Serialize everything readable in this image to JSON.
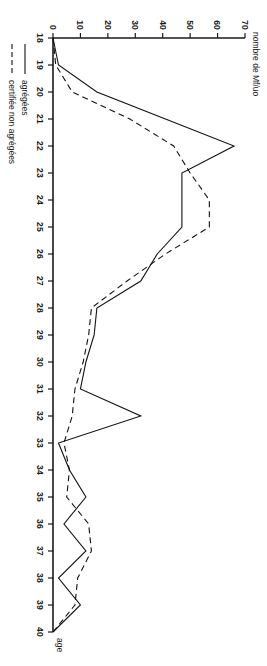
{
  "chart_data": {
    "type": "line",
    "title": "",
    "subtitle": "",
    "orientation": "rotated-90-ccw",
    "xlabel": "age",
    "ylabel": "nombre de Mf/uo",
    "x": [
      18,
      19,
      20,
      21,
      22,
      23,
      24,
      25,
      26,
      27,
      28,
      29,
      30,
      31,
      32,
      33,
      34,
      35,
      36,
      37,
      38,
      39,
      40
    ],
    "xlim": [
      18,
      40
    ],
    "ylim": [
      0,
      70
    ],
    "xticks": [
      "18",
      "19",
      "20",
      "21",
      "22",
      "23",
      "24",
      "25",
      "26",
      "27",
      "28",
      "29",
      "30",
      "31",
      "32",
      "33",
      "34",
      "35",
      "36",
      "37",
      "38",
      "39",
      "40"
    ],
    "yticks": [
      "0",
      "10",
      "20",
      "30",
      "40",
      "50",
      "60",
      "70"
    ],
    "grid": false,
    "legend_position": "bottom-left",
    "series": [
      {
        "name": "agrégées",
        "style": "solid",
        "color": "#111111",
        "values": [
          0,
          2,
          16,
          41,
          66,
          47,
          47,
          47,
          38,
          32,
          16,
          15,
          12,
          10,
          32,
          2,
          6,
          12,
          4,
          12,
          2,
          10,
          0
        ]
      },
      {
        "name": "certifiée non agrégées",
        "style": "dashed",
        "color": "#111111",
        "values": [
          0,
          1,
          7,
          28,
          44,
          50,
          57,
          57,
          41,
          27,
          14,
          13,
          11,
          8,
          7,
          4,
          6,
          5,
          13,
          14,
          9,
          8,
          0
        ]
      }
    ]
  },
  "axes": {
    "x_axis_title": "age",
    "y_axis_title": "nombre de Mf/uo",
    "x_tick_labels": [
      "18",
      "19",
      "20",
      "21",
      "22",
      "23",
      "24",
      "25",
      "26",
      "27",
      "28",
      "29",
      "30",
      "31",
      "32",
      "33",
      "34",
      "35",
      "36",
      "37",
      "38",
      "39",
      "40"
    ],
    "y_tick_labels": [
      "0",
      "10",
      "20",
      "30",
      "40",
      "50",
      "60",
      "70"
    ]
  },
  "legend": {
    "items": [
      {
        "label": "agrégées",
        "style": "solid"
      },
      {
        "label": "certifiée non agrégées",
        "style": "dashed"
      }
    ]
  }
}
